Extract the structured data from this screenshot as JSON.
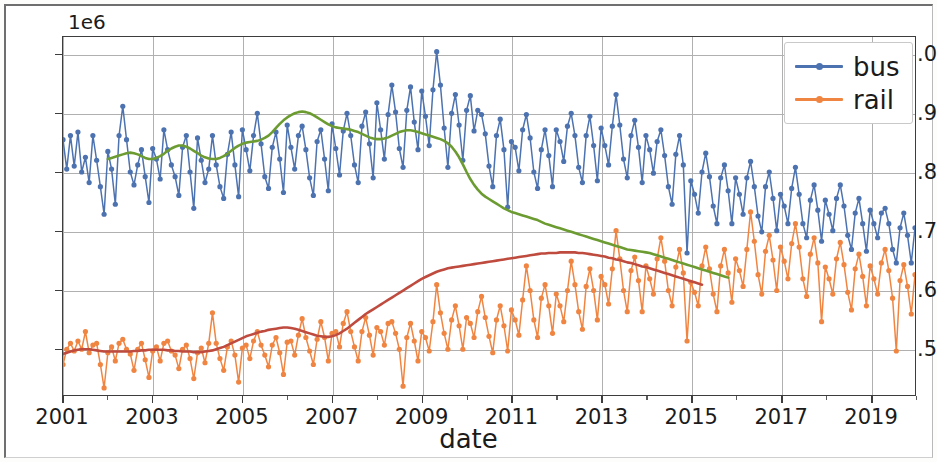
{
  "figure": {
    "xlabel": "date",
    "y_offset_label": "1e6",
    "ylabel": "",
    "title": ""
  },
  "axes": {
    "y_ticks": [
      "0.5",
      "0.6",
      "0.7",
      "0.8",
      "0.9",
      "1.0"
    ],
    "x_ticks": [
      "2001",
      "2003",
      "2005",
      "2007",
      "2009",
      "2011",
      "2013",
      "2015",
      "2017",
      "2019"
    ]
  },
  "legend": {
    "position": "upper right",
    "items": [
      {
        "label": "bus",
        "color": "#4c72b0",
        "marker": "circle"
      },
      {
        "label": "rail",
        "color": "#f08542",
        "marker": "circle"
      }
    ]
  },
  "colors": {
    "bus": "#4c72b0",
    "rail": "#f08542",
    "bus_trend": "#6c9c31",
    "rail_trend": "#bf4b3f",
    "axis": "#3d3d3d",
    "grid": "#b0b0b0",
    "background": "#ffffff"
  },
  "chart_data": {
    "type": "line",
    "title": "",
    "xlabel": "date",
    "ylabel": "",
    "y_offset": 1000000,
    "xlim": [
      2001.0,
      2020.0
    ],
    "ylim": [
      420000,
      1030000
    ],
    "grid": true,
    "legend_position": "upper right",
    "x_tick_values": [
      2001,
      2003,
      2005,
      2007,
      2009,
      2011,
      2013,
      2015,
      2017,
      2019
    ],
    "y_tick_values": [
      500000,
      600000,
      700000,
      800000,
      900000,
      1000000
    ],
    "x_start": 2001.0,
    "x_step_months": 1,
    "series": [
      {
        "name": "bus",
        "color": "#4c72b0",
        "marker": "circle",
        "values": [
          855000,
          805000,
          862000,
          810000,
          868000,
          800000,
          825000,
          782000,
          862000,
          820000,
          775000,
          728000,
          835000,
          805000,
          745000,
          862000,
          912000,
          855000,
          800000,
          778000,
          812000,
          838000,
          792000,
          748000,
          840000,
          822000,
          788000,
          872000,
          838000,
          812000,
          792000,
          760000,
          842000,
          862000,
          800000,
          738000,
          858000,
          820000,
          782000,
          805000,
          862000,
          812000,
          775000,
          755000,
          830000,
          868000,
          812000,
          758000,
          872000,
          838000,
          802000,
          862000,
          900000,
          848000,
          792000,
          772000,
          842000,
          868000,
          822000,
          765000,
          880000,
          842000,
          805000,
          862000,
          878000,
          838000,
          790000,
          760000,
          852000,
          872000,
          822000,
          768000,
          882000,
          840000,
          795000,
          870000,
          900000,
          862000,
          812000,
          782000,
          878000,
          902000,
          848000,
          790000,
          918000,
          872000,
          822000,
          898000,
          948000,
          902000,
          840000,
          808000,
          905000,
          945000,
          885000,
          838000,
          938000,
          895000,
          845000,
          940000,
          1005000,
          948000,
          875000,
          808000,
          900000,
          932000,
          880000,
          820000,
          905000,
          930000,
          870000,
          905000,
          898000,
          865000,
          810000,
          775000,
          862000,
          890000,
          838000,
          740000,
          852000,
          842000,
          802000,
          872000,
          898000,
          858000,
          800000,
          772000,
          838000,
          872000,
          828000,
          775000,
          872000,
          852000,
          818000,
          878000,
          900000,
          862000,
          808000,
          782000,
          862000,
          895000,
          845000,
          785000,
          875000,
          845000,
          812000,
          878000,
          932000,
          880000,
          822000,
          790000,
          862000,
          888000,
          842000,
          782000,
          862000,
          838000,
          798000,
          852000,
          872000,
          828000,
          775000,
          745000,
          830000,
          862000,
          812000,
          662000,
          785000,
          762000,
          730000,
          800000,
          832000,
          792000,
          742000,
          712000,
          790000,
          812000,
          768000,
          712000,
          790000,
          762000,
          728000,
          790000,
          818000,
          775000,
          725000,
          698000,
          775000,
          800000,
          755000,
          700000,
          762000,
          742000,
          712000,
          772000,
          808000,
          762000,
          712000,
          688000,
          752000,
          778000,
          735000,
          682000,
          752000,
          728000,
          700000,
          755000,
          778000,
          742000,
          692000,
          668000,
          730000,
          755000,
          712000,
          665000,
          735000,
          712000,
          688000,
          730000,
          738000,
          712000,
          668000,
          645000,
          705000,
          730000,
          692000,
          645000,
          705000,
          688000,
          662000,
          705000,
          722000,
          700000,
          655000,
          632000,
          688000,
          712000,
          675000,
          628000,
          688000,
          668000,
          645000,
          692000,
          705000,
          682000,
          640000,
          618000,
          672000,
          700000,
          662000,
          615000,
          672000,
          655000,
          632000
        ]
      },
      {
        "name": "rail",
        "color": "#f08542",
        "marker": "circle",
        "values": [
          472000,
          498000,
          508000,
          495000,
          512000,
          498000,
          528000,
          492000,
          505000,
          508000,
          472000,
          432000,
          492000,
          502000,
          478000,
          508000,
          515000,
          498000,
          490000,
          462000,
          498000,
          508000,
          480000,
          450000,
          495000,
          502000,
          478000,
          508000,
          512000,
          495000,
          488000,
          465000,
          498000,
          505000,
          482000,
          448000,
          492000,
          500000,
          475000,
          508000,
          560000,
          508000,
          482000,
          462000,
          502000,
          512000,
          488000,
          442000,
          500000,
          505000,
          482000,
          512000,
          528000,
          505000,
          488000,
          468000,
          505000,
          518000,
          492000,
          455000,
          510000,
          512000,
          488000,
          522000,
          550000,
          518000,
          495000,
          472000,
          515000,
          545000,
          518000,
          478000,
          525000,
          528000,
          502000,
          542000,
          562000,
          528000,
          502000,
          478000,
          528000,
          552000,
          522000,
          488000,
          535000,
          528000,
          505000,
          542000,
          545000,
          525000,
          498000,
          435000,
          518000,
          542000,
          512000,
          478000,
          528000,
          518000,
          495000,
          545000,
          608000,
          560000,
          525000,
          498000,
          548000,
          572000,
          538000,
          498000,
          552000,
          542000,
          518000,
          562000,
          588000,
          552000,
          520000,
          492000,
          548000,
          572000,
          538000,
          495000,
          565000,
          548000,
          522000,
          582000,
          640000,
          598000,
          548000,
          518000,
          585000,
          608000,
          572000,
          525000,
          592000,
          572000,
          545000,
          598000,
          648000,
          608000,
          562000,
          532000,
          605000,
          635000,
          598000,
          548000,
          622000,
          608000,
          575000,
          635000,
          700000,
          652000,
          598000,
          562000,
          632000,
          655000,
          615000,
          562000,
          640000,
          618000,
          592000,
          652000,
          688000,
          648000,
          598000,
          572000,
          638000,
          668000,
          628000,
          512000,
          612000,
          595000,
          572000,
          640000,
          672000,
          635000,
          592000,
          562000,
          640000,
          668000,
          628000,
          578000,
          652000,
          632000,
          605000,
          668000,
          732000,
          682000,
          625000,
          592000,
          665000,
          692000,
          650000,
          598000,
          672000,
          648000,
          618000,
          678000,
          712000,
          672000,
          618000,
          588000,
          660000,
          688000,
          645000,
          545000,
          638000,
          618000,
          592000,
          652000,
          680000,
          642000,
          595000,
          565000,
          635000,
          660000,
          622000,
          572000,
          640000,
          618000,
          592000,
          645000,
          668000,
          632000,
          585000,
          495000,
          615000,
          642000,
          605000,
          558000,
          625000,
          602000,
          578000,
          632000,
          655000,
          618000,
          572000,
          545000,
          612000,
          638000,
          598000,
          495000,
          598000,
          578000,
          558000,
          612000,
          638000,
          602000,
          558000,
          528000,
          598000,
          622000,
          585000,
          522000,
          598000,
          578000,
          652000
        ]
      }
    ],
    "trend_series": [
      {
        "name": "bus_trend",
        "color": "#6c9c31",
        "x_start": 2002.0,
        "values": [
          822000,
          824000,
          826000,
          828000,
          830000,
          832000,
          833000,
          832000,
          830000,
          827000,
          824000,
          822000,
          822000,
          824000,
          827000,
          831000,
          836000,
          840000,
          843000,
          845000,
          845000,
          843000,
          840000,
          836000,
          832000,
          828000,
          825000,
          823000,
          822000,
          822000,
          824000,
          827000,
          831000,
          836000,
          841000,
          845000,
          848000,
          850000,
          851000,
          852000,
          853000,
          855000,
          858000,
          862000,
          868000,
          875000,
          882000,
          888000,
          893000,
          897000,
          900000,
          902000,
          903000,
          902000,
          900000,
          897000,
          893000,
          889000,
          885000,
          881000,
          878000,
          876000,
          875000,
          874000,
          873000,
          872000,
          870000,
          868000,
          865000,
          862000,
          859000,
          857000,
          856000,
          856000,
          857000,
          859000,
          862000,
          865000,
          868000,
          870000,
          871000,
          871000,
          870000,
          868000,
          866000,
          864000,
          862000,
          860000,
          858000,
          856000,
          853000,
          849000,
          843000,
          835000,
          825000,
          813000,
          800000,
          788000,
          778000,
          770000,
          763000,
          758000,
          754000,
          750000,
          746000,
          742000,
          738000,
          735000,
          732000,
          730000,
          728000,
          726000,
          724000,
          722000,
          720000,
          718000,
          715000,
          712000,
          710000,
          708000,
          706000,
          704000,
          702000,
          700000,
          698000,
          696000,
          694000,
          692000,
          690000,
          688000,
          686000,
          684000,
          682000,
          680000,
          678000,
          676000,
          674000,
          672000,
          670000,
          668000,
          667000,
          666000,
          665000,
          664000,
          663000,
          662000,
          660000,
          658000,
          656000,
          654000,
          652000,
          650000,
          648000,
          646000,
          644000,
          642000,
          640000,
          638000,
          636000,
          634000,
          632000,
          630000,
          628000,
          626000,
          624000,
          622000,
          620000
        ]
      },
      {
        "name": "rail_trend",
        "color": "#bf4b3f",
        "x_start": 2001.0,
        "values": [
          490000,
          492000,
          494000,
          496000,
          497000,
          498000,
          498000,
          498000,
          497000,
          496000,
          495000,
          494000,
          494000,
          494000,
          494000,
          494000,
          494000,
          494000,
          494000,
          495000,
          495000,
          496000,
          496000,
          497000,
          497000,
          497000,
          497000,
          497000,
          496000,
          496000,
          495000,
          495000,
          494000,
          494000,
          494000,
          493000,
          493000,
          493000,
          494000,
          495000,
          496000,
          498000,
          500000,
          502000,
          505000,
          508000,
          511000,
          514000,
          517000,
          520000,
          522000,
          524000,
          526000,
          528000,
          529000,
          531000,
          532000,
          533000,
          534000,
          535000,
          535000,
          534000,
          533000,
          531000,
          529000,
          527000,
          525000,
          523000,
          521000,
          520000,
          519000,
          519000,
          520000,
          522000,
          525000,
          529000,
          533000,
          538000,
          543000,
          548000,
          553000,
          558000,
          562000,
          566000,
          570000,
          574000,
          578000,
          582000,
          586000,
          590000,
          594000,
          598000,
          602000,
          606000,
          610000,
          614000,
          618000,
          621000,
          624000,
          627000,
          630000,
          632000,
          634000,
          636000,
          637000,
          638000,
          639000,
          640000,
          641000,
          642000,
          643000,
          644000,
          645000,
          646000,
          647000,
          648000,
          649000,
          650000,
          651000,
          652000,
          653000,
          654000,
          655000,
          656000,
          657000,
          658000,
          659000,
          660000,
          661000,
          661000,
          662000,
          662000,
          662000,
          663000,
          663000,
          663000,
          663000,
          663000,
          662000,
          662000,
          661000,
          660000,
          659000,
          658000,
          657000,
          656000,
          654000,
          653000,
          651000,
          650000,
          648000,
          646000,
          645000,
          643000,
          641000,
          639000,
          638000,
          636000,
          634000,
          632000,
          630000,
          628000,
          626000,
          624000,
          622000,
          620000,
          618000,
          616000,
          614000,
          612000,
          610000,
          608000
        ]
      }
    ]
  }
}
